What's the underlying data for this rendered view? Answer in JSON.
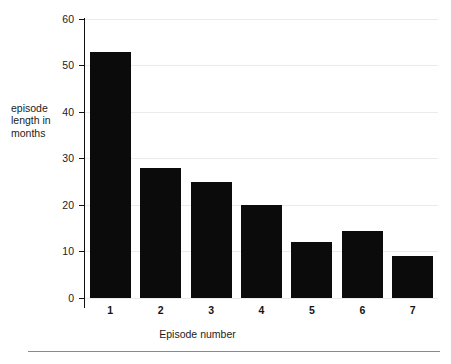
{
  "chart_data": {
    "type": "bar",
    "title": "",
    "subtitle": "",
    "xlabel": "Episode number",
    "ylabel": "episode\nlength in\nmonths",
    "categories": [
      "1",
      "2",
      "3",
      "4",
      "5",
      "6",
      "7"
    ],
    "values": [
      53,
      28,
      25,
      20,
      12,
      14.5,
      9
    ],
    "ylim": [
      0,
      60
    ],
    "yticks": [
      0,
      10,
      20,
      30,
      40,
      50,
      60
    ],
    "ytick_labels": [
      "0",
      "10",
      "20",
      "30",
      "40",
      "50",
      "60"
    ],
    "xtick_labels": [
      "1",
      "2",
      "3",
      "4",
      "5",
      "6",
      "7"
    ],
    "grid": true,
    "grid_axis": "y",
    "legend": false,
    "legend_position": "none",
    "bar_color": "#0b0b0b",
    "grid_color": "#ebebef",
    "axis_color": "#111111",
    "background_color": "#ffffff",
    "annotations": []
  },
  "figure": {
    "y_axis_title": "episode\nlength in\nmonths",
    "x_axis_title": "Episode number"
  }
}
